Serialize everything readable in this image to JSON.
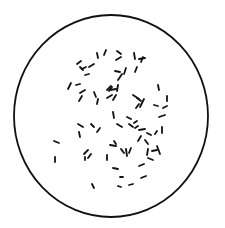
{
  "figure": {
    "background": "#ffffff",
    "stroke_color": "#111111",
    "field": {
      "cx": 111,
      "cy": 116,
      "rx": 97,
      "ry": 101,
      "stroke_width": 1.8
    },
    "rods": [
      [
        97,
        53,
        98,
        58
      ],
      [
        106,
        50,
        104,
        55
      ],
      [
        117,
        51,
        121,
        54
      ],
      [
        121,
        57,
        116,
        60
      ],
      [
        134,
        53,
        135,
        59
      ],
      [
        143,
        57,
        141,
        62
      ],
      [
        145,
        58,
        139,
        59
      ],
      [
        81,
        61,
        77,
        64
      ],
      [
        80,
        67,
        83,
        70
      ],
      [
        86,
        67,
        82,
        69
      ],
      [
        94,
        64,
        89,
        67
      ],
      [
        89,
        74,
        85,
        75
      ],
      [
        115,
        71,
        120,
        72
      ],
      [
        126,
        68,
        124,
        74
      ],
      [
        137,
        67,
        135,
        72
      ],
      [
        122,
        74,
        118,
        80
      ],
      [
        71,
        83,
        68,
        89
      ],
      [
        80,
        84,
        76,
        85
      ],
      [
        85,
        90,
        80,
        93
      ],
      [
        82,
        96,
        79,
        101
      ],
      [
        94,
        92,
        96,
        97
      ],
      [
        98,
        99,
        97,
        104
      ],
      [
        107,
        90,
        111,
        86
      ],
      [
        112,
        87,
        109,
        91
      ],
      [
        116,
        89,
        110,
        90
      ],
      [
        107,
        98,
        112,
        95
      ],
      [
        116,
        95,
        113,
        100
      ],
      [
        118,
        85,
        117,
        91
      ],
      [
        133,
        95,
        139,
        99
      ],
      [
        137,
        98,
        141,
        101
      ],
      [
        136,
        108,
        139,
        104
      ],
      [
        144,
        99,
        140,
        107
      ],
      [
        158,
        85,
        159,
        90
      ],
      [
        154,
        105,
        158,
        106
      ],
      [
        167,
        96,
        167,
        101
      ],
      [
        167,
        106,
        163,
        108
      ],
      [
        165,
        115,
        159,
        117
      ],
      [
        113,
        112,
        114,
        118
      ],
      [
        117,
        124,
        122,
        127
      ],
      [
        127,
        117,
        131,
        119
      ],
      [
        129,
        124,
        133,
        127
      ],
      [
        134,
        123,
        137,
        121
      ],
      [
        135,
        128,
        138,
        126
      ],
      [
        139,
        130,
        145,
        129
      ],
      [
        147,
        133,
        151,
        135
      ],
      [
        157,
        131,
        155,
        134
      ],
      [
        162,
        127,
        162,
        133
      ],
      [
        141,
        136,
        138,
        141
      ],
      [
        145,
        140,
        148,
        144
      ],
      [
        148,
        149,
        147,
        155
      ],
      [
        152,
        151,
        157,
        150
      ],
      [
        157,
        146,
        160,
        154
      ],
      [
        148,
        158,
        153,
        160
      ],
      [
        78,
        124,
        83,
        127
      ],
      [
        91,
        124,
        94,
        127
      ],
      [
        100,
        128,
        97,
        132
      ],
      [
        79,
        132,
        80,
        137
      ],
      [
        54,
        141,
        59,
        143
      ],
      [
        55,
        157,
        55,
        162
      ],
      [
        88,
        150,
        84,
        154
      ],
      [
        91,
        154,
        88,
        158
      ],
      [
        85,
        157,
        85,
        160
      ],
      [
        110,
        145,
        116,
        146
      ],
      [
        114,
        141,
        116,
        144
      ],
      [
        107,
        155,
        107,
        160
      ],
      [
        121,
        149,
        124,
        153
      ],
      [
        126,
        149,
        127,
        156
      ],
      [
        131,
        148,
        129,
        153
      ],
      [
        113,
        168,
        118,
        169
      ],
      [
        120,
        177,
        123,
        177
      ],
      [
        118,
        186,
        121,
        187
      ],
      [
        129,
        185,
        133,
        184
      ],
      [
        144,
        164,
        139,
        166
      ],
      [
        146,
        176,
        141,
        178
      ],
      [
        92,
        184,
        94,
        188
      ]
    ]
  }
}
